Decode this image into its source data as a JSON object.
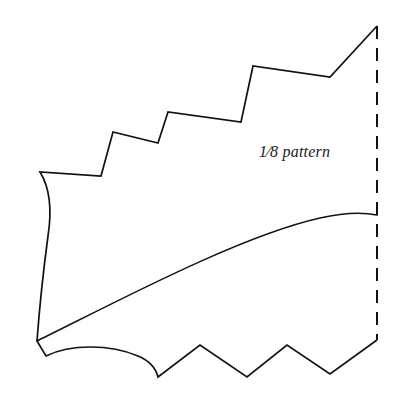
{
  "figure": {
    "kind": "line-art pattern diagram",
    "background_color": "#ffffff",
    "ink_color": "#121212",
    "canvas": {
      "width": 402,
      "height": 397
    }
  },
  "label": {
    "full_text": "⅛ pattern",
    "numerator": "1",
    "solidus": "⁄",
    "denominator": "8",
    "word": "pattern",
    "style": "italic serif",
    "position": {
      "x": 259,
      "y": 143
    }
  },
  "outline": {
    "name": "pattern-outline",
    "description": "Outer boundary of the one-eighth pattern wedge: stepped top edge, curved left edge, scalloped and zigzag bottom edge.",
    "path": "M 377 26 L 330 77 L 253 66 L 241 122 L 168 112 L 158 143 L 113 132 L 101 176 L 40 172 C 50 188 52 210 48 236 C 44 266 40 300 37 341 L 46 356 C 70 344 110 344 138 356 C 150 361 156 369 158 377 L 200 345 L 247 377 L 287 345 L 330 374 L 377 340",
    "stroke_color": "#121212",
    "stroke_width": 1.7
  },
  "inner_arc": {
    "name": "inner-seam-arc",
    "description": "Interior sweeping curve from the lower-left corner up to the right fold line.",
    "path": "M 37 341 C 120 300 240 236 320 218 C 342 213 362 212 377 215",
    "stroke_color": "#121212",
    "stroke_width": 1.5
  },
  "fold_line": {
    "name": "fold-line",
    "description": "Dashed vertical fold / center line at the right edge.",
    "x": 377,
    "y_top": 26,
    "y_bottom": 340,
    "dash_pattern": "13 9",
    "stroke_color": "#121212",
    "stroke_width": 2.0
  },
  "top_edge_vertices": [
    {
      "x": 377,
      "y": 26,
      "kind": "peak"
    },
    {
      "x": 330,
      "y": 77,
      "kind": "valley"
    },
    {
      "x": 253,
      "y": 66,
      "kind": "step-corner"
    },
    {
      "x": 241,
      "y": 122,
      "kind": "step-corner"
    },
    {
      "x": 168,
      "y": 112,
      "kind": "step-corner"
    },
    {
      "x": 158,
      "y": 143,
      "kind": "step-corner"
    },
    {
      "x": 113,
      "y": 132,
      "kind": "step-corner"
    },
    {
      "x": 101,
      "y": 176,
      "kind": "step-corner"
    },
    {
      "x": 40,
      "y": 172,
      "kind": "left-shoulder"
    }
  ],
  "bottom_edge_vertices": [
    {
      "x": 37,
      "y": 341,
      "kind": "corner"
    },
    {
      "x": 46,
      "y": 356,
      "kind": "corner"
    },
    {
      "x": 158,
      "y": 377,
      "kind": "valley"
    },
    {
      "x": 200,
      "y": 345,
      "kind": "peak"
    },
    {
      "x": 247,
      "y": 377,
      "kind": "valley"
    },
    {
      "x": 287,
      "y": 345,
      "kind": "peak"
    },
    {
      "x": 330,
      "y": 374,
      "kind": "valley"
    },
    {
      "x": 377,
      "y": 340,
      "kind": "fold-end"
    }
  ]
}
